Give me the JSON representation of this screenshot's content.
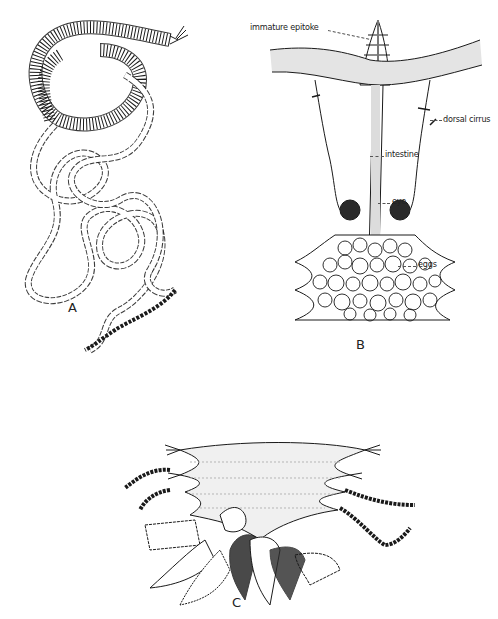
{
  "figure": {
    "panels": [
      {
        "id": "A",
        "label": "A",
        "description": "Whole worm with coiled anterior body and long beaded posterior chain (stolons)"
      },
      {
        "id": "B",
        "label": "B",
        "description": "Ventral view of reproductive segment region",
        "annotations": [
          {
            "text": "immature epitoke",
            "target": "budding tip"
          },
          {
            "text": "dorsal cirrus",
            "target": "parapodial cirrus"
          },
          {
            "text": "intestine",
            "target": "central gut"
          },
          {
            "text": "eye",
            "target": "pigmented eye spots"
          },
          {
            "text": "eggs",
            "target": "egg mass"
          }
        ]
      },
      {
        "id": "C",
        "label": "C",
        "description": "Segments with beaded cirri and branching gill-like appendages"
      }
    ]
  },
  "style": {
    "ink": "#1a1a1a",
    "stipple": "#bdbdbd",
    "background": "#ffffff"
  }
}
